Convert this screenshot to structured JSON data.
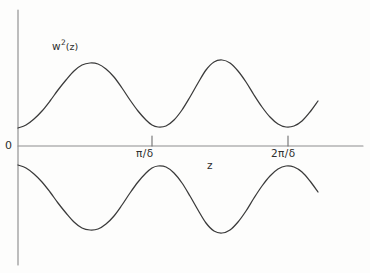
{
  "figure": {
    "name": "w-squared-envelope-sketch",
    "style": "hand-drawn line sketch",
    "background_color": "#fdfdfc",
    "curve_color": "#3a3a3a",
    "axis_color": "#8e8e8e"
  },
  "labels": {
    "origin": "0",
    "curve_base": "w",
    "curve_exponent": "2",
    "curve_argument": "(z)",
    "curve_full": "w2(z)",
    "xaxis": "z",
    "tick_1": "π/δ",
    "tick_2": "2π/δ"
  },
  "chart_data": {
    "type": "line",
    "title": "",
    "subtitle": "",
    "xlabel": "z",
    "ylabel": "w2(z)",
    "grid": false,
    "legend": null,
    "axes": {
      "y_axis_x_px": 18,
      "y_axis_top_px": 10,
      "y_axis_bottom_px": 265,
      "x_axis_y_px": 146,
      "x_axis_left_px": 18,
      "x_axis_right_px": 363
    },
    "xticks": {
      "positions_px": [
        152,
        288
      ],
      "labels": [
        "π/δ",
        "2π/δ"
      ],
      "tick_direction": "up"
    },
    "xlim": [
      0,
      2.54
    ],
    "ylim": [
      -1.2,
      1.2
    ],
    "series": [
      {
        "name": "upper envelope w2(z)",
        "description": "oscillating positive branch, two crests",
        "points_px": [
          [
            18,
            128
          ],
          [
            26,
            125
          ],
          [
            34,
            119
          ],
          [
            42,
            111
          ],
          [
            50,
            101
          ],
          [
            58,
            90
          ],
          [
            66,
            80
          ],
          [
            74,
            71
          ],
          [
            82,
            65
          ],
          [
            90,
            63
          ],
          [
            98,
            64
          ],
          [
            106,
            69
          ],
          [
            114,
            77
          ],
          [
            122,
            88
          ],
          [
            130,
            100
          ],
          [
            138,
            111
          ],
          [
            146,
            120
          ],
          [
            152,
            125
          ],
          [
            158,
            127
          ],
          [
            166,
            126
          ],
          [
            174,
            120
          ],
          [
            182,
            110
          ],
          [
            190,
            97
          ],
          [
            198,
            83
          ],
          [
            206,
            70
          ],
          [
            214,
            62
          ],
          [
            222,
            60
          ],
          [
            230,
            63
          ],
          [
            238,
            71
          ],
          [
            246,
            82
          ],
          [
            254,
            95
          ],
          [
            262,
            107
          ],
          [
            270,
            117
          ],
          [
            278,
            124
          ],
          [
            286,
            127
          ],
          [
            294,
            126
          ],
          [
            302,
            121
          ],
          [
            310,
            112
          ],
          [
            318,
            101
          ]
        ]
      },
      {
        "name": "lower envelope -w2(z)",
        "description": "mirror image of upper branch below the z-axis",
        "points_px": [
          [
            18,
            165
          ],
          [
            26,
            168
          ],
          [
            34,
            174
          ],
          [
            42,
            182
          ],
          [
            50,
            192
          ],
          [
            58,
            203
          ],
          [
            66,
            213
          ],
          [
            74,
            222
          ],
          [
            82,
            228
          ],
          [
            90,
            230
          ],
          [
            98,
            229
          ],
          [
            106,
            224
          ],
          [
            114,
            216
          ],
          [
            122,
            205
          ],
          [
            130,
            193
          ],
          [
            138,
            182
          ],
          [
            146,
            173
          ],
          [
            152,
            168
          ],
          [
            158,
            166
          ],
          [
            166,
            167
          ],
          [
            174,
            173
          ],
          [
            182,
            183
          ],
          [
            190,
            196
          ],
          [
            198,
            210
          ],
          [
            206,
            223
          ],
          [
            214,
            231
          ],
          [
            222,
            233
          ],
          [
            230,
            230
          ],
          [
            238,
            222
          ],
          [
            246,
            211
          ],
          [
            254,
            198
          ],
          [
            262,
            186
          ],
          [
            270,
            176
          ],
          [
            278,
            169
          ],
          [
            286,
            166
          ],
          [
            294,
            167
          ],
          [
            302,
            172
          ],
          [
            310,
            181
          ],
          [
            318,
            192
          ]
        ]
      }
    ],
    "annotations": [
      {
        "text": "w2(z)",
        "x_px": 52,
        "y_px": 39,
        "target": "upper-curve"
      },
      {
        "text": "0",
        "x_px": 5,
        "y_px": 140,
        "target": "origin"
      },
      {
        "text": "z",
        "x_px": 207,
        "y_px": 160,
        "target": "x-axis"
      }
    ]
  }
}
